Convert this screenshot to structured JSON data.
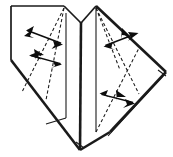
{
  "figure": {
    "domain": "Diagram",
    "canvas": {
      "width": 173,
      "height": 157,
      "background": "#ffffff"
    },
    "colors": {
      "line": "#1a1a1a",
      "arrow": "#0d0d0d",
      "paper": "#ffffff"
    }
  },
  "shapes": {
    "left_panel": {
      "name": "left-paper-panel",
      "points": "11,6 64,6 64,60 46,124 11,60"
    },
    "left_outline": {
      "name": "left-panel-outline",
      "points": "11,6 64,6 64,118 46,124 11,60"
    },
    "left_top_edge": {
      "from": [
        11,
        6
      ],
      "to": [
        64,
        6
      ]
    },
    "left_vertical_edge": {
      "from": [
        11,
        6
      ],
      "to": [
        11,
        60
      ]
    },
    "left_lower_edge": {
      "from": [
        11,
        60
      ],
      "to": [
        80,
        150
      ]
    },
    "peak_left": [
      64,
      6
    ],
    "valley_mid": [
      80,
      22
    ],
    "peak_right": [
      96,
      6
    ],
    "right_tip": [
      166,
      72
    ],
    "bottom_point": [
      80,
      150
    ],
    "left_vertex": [
      11,
      60
    ],
    "spine_lines": [
      {
        "name": "inner-left-fold",
        "from": [
          66,
          13
        ],
        "to": [
          66,
          118
        ]
      },
      {
        "name": "center-spine",
        "from": [
          81,
          22
        ],
        "to": [
          80,
          150
        ]
      },
      {
        "name": "inner-right-fold",
        "from": [
          96,
          8
        ],
        "to": [
          96,
          132
        ]
      }
    ],
    "right_panel": {
      "name": "right-paper-panel",
      "points": "96,6 166,72 110,132 96,132"
    }
  },
  "creases": [
    {
      "name": "crease-left-outer",
      "from": [
        64,
        8
      ],
      "to": [
        22,
        92
      ]
    },
    {
      "name": "crease-left-inner",
      "from": [
        64,
        8
      ],
      "to": [
        46,
        100
      ]
    },
    {
      "name": "crease-right-upper",
      "from": [
        96,
        8
      ],
      "to": [
        139,
        94
      ]
    },
    {
      "name": "crease-right-lower",
      "from": [
        96,
        132
      ],
      "to": [
        139,
        48
      ]
    },
    {
      "name": "crease-right-mid",
      "from": [
        96,
        8
      ],
      "to": [
        120,
        70
      ]
    }
  ],
  "arrows": [
    {
      "id": 1,
      "name": "fold-arrow-left-upper",
      "label": "valley fold left flap upper",
      "tail": [
        26,
        30
      ],
      "tip": [
        63,
        44
      ],
      "direction": "right-down",
      "double_headed": true
    },
    {
      "id": 2,
      "name": "fold-arrow-left-lower",
      "label": "valley fold left flap lower",
      "tail": [
        62,
        64
      ],
      "tip": [
        29,
        55
      ],
      "direction": "left-up",
      "double_headed": true
    },
    {
      "id": 3,
      "name": "fold-arrow-right-upper",
      "label": "valley fold right flap upper",
      "tail": [
        104,
        46
      ],
      "tip": [
        138,
        33
      ],
      "direction": "right-up",
      "double_headed": true
    },
    {
      "id": 4,
      "name": "fold-arrow-right-lower",
      "label": "valley fold right flap lower",
      "tail": [
        100,
        94
      ],
      "tip": [
        135,
        103
      ],
      "direction": "right-down",
      "double_headed": true
    }
  ]
}
